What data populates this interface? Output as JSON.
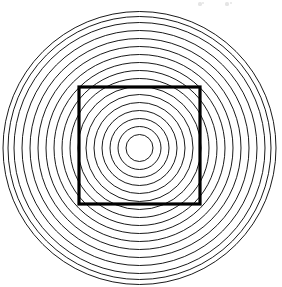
{
  "figure": {
    "canvas": {
      "width": 282,
      "height": 287,
      "background": "#ffffff"
    },
    "stroke_color": "#000000",
    "ring_stroke_width": 0.9,
    "square_stroke_color": "#000000",
    "square_stroke_width": 3.2
  },
  "chart_data": {
    "type": "scatter",
    "xlabel": "",
    "ylabel": "",
    "grid": false,
    "legend": null,
    "xlim": [
      0,
      282
    ],
    "ylim": [
      0,
      287
    ],
    "center": {
      "x": 139.5,
      "y": 148
    },
    "circle_count": 17,
    "circle_radii": [
      13.5,
      21.5,
      29.5,
      37.5,
      45.5,
      53.5,
      61.5,
      69.5,
      77.5,
      85.5,
      93.5,
      101.5,
      109.5,
      117.5,
      125.5,
      131.5,
      136.5
    ],
    "radius_step": 8,
    "square": {
      "x": 79,
      "y": 87,
      "width": 121,
      "height": 117,
      "left": 79,
      "top": 87,
      "right": 200,
      "bottom": 204
    },
    "artifacts": [
      {
        "x": 200,
        "y": 4,
        "r": 1.6
      },
      {
        "x": 203,
        "y": 3,
        "r": 1.2
      },
      {
        "x": 227,
        "y": 4,
        "r": 1.6
      },
      {
        "x": 231,
        "y": 3,
        "r": 1.2
      }
    ]
  }
}
